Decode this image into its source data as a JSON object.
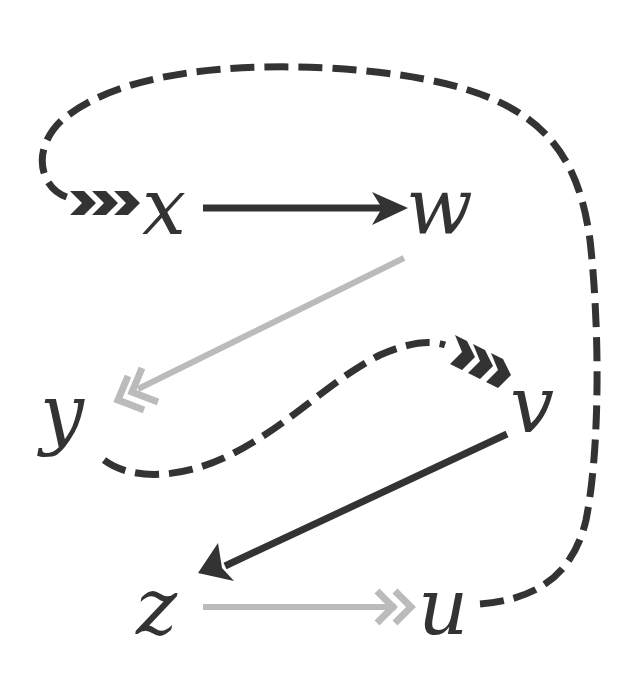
{
  "diagram": {
    "type": "commutative-diagram",
    "colors": {
      "dark": "#333333",
      "light": "#bbbbbb",
      "background": "#ffffff"
    },
    "nodes": [
      {
        "id": "x",
        "label": "x"
      },
      {
        "id": "w",
        "label": "w"
      },
      {
        "id": "y",
        "label": "y"
      },
      {
        "id": "v",
        "label": "v"
      },
      {
        "id": "z",
        "label": "z"
      },
      {
        "id": "u",
        "label": "u"
      }
    ],
    "edges": [
      {
        "from": "x",
        "to": "w",
        "style": "solid",
        "color": "dark",
        "head": "single"
      },
      {
        "from": "w",
        "to": "y",
        "style": "solid",
        "color": "light",
        "head": "double-chevron"
      },
      {
        "from": "y",
        "to": "v",
        "style": "dashed",
        "color": "dark",
        "head": "triple-chevron"
      },
      {
        "from": "v",
        "to": "z",
        "style": "solid",
        "color": "dark",
        "head": "single"
      },
      {
        "from": "z",
        "to": "u",
        "style": "solid",
        "color": "light",
        "head": "double-chevron"
      },
      {
        "from": "u",
        "to": "x",
        "style": "dashed",
        "color": "dark",
        "head": "triple-chevron"
      }
    ]
  }
}
